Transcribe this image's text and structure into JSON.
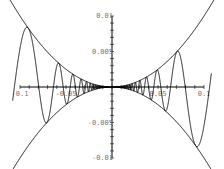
{
  "chart_data": {
    "type": "line",
    "title": "",
    "xlabel": "",
    "ylabel": "",
    "xlim": [
      -0.1,
      0.1
    ],
    "ylim": [
      -0.01,
      0.01
    ],
    "grid": false,
    "legend": null,
    "x_ticks": [
      {
        "value": -0.1,
        "label": "-0.1"
      },
      {
        "value": -0.05,
        "label": "-0.05"
      },
      {
        "value": 0.05,
        "label": "0.05"
      },
      {
        "value": 0.1,
        "label": "0.1"
      }
    ],
    "y_ticks": [
      {
        "value": 0.01,
        "label": "0.01"
      },
      {
        "value": 0.005,
        "label": "0.005"
      },
      {
        "value": -0.005,
        "label": "-0.005"
      },
      {
        "value": -0.01,
        "label": "-0.01"
      }
    ],
    "series": [
      {
        "name": "x^2",
        "expression": "x^2",
        "x_range": [
          -0.12,
          0.12
        ],
        "color": "#000000"
      },
      {
        "name": "-x^2",
        "expression": "-x^2",
        "x_range": [
          -0.12,
          0.12
        ],
        "color": "#000000"
      },
      {
        "name": "x^2 sin(1/x)",
        "expression": "x^2*sin(1/x)",
        "x_range": [
          -0.108,
          0.108
        ],
        "color": "#000000"
      }
    ]
  },
  "layout": {
    "origin_px": [
      112,
      87
    ],
    "px_per_x_unit": 920,
    "px_per_y_unit": 7100
  }
}
